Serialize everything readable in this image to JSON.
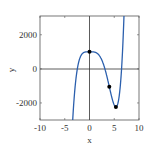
{
  "chart_data": {
    "type": "line",
    "title": "",
    "xlabel": "x",
    "ylabel": "y",
    "xlim": [
      -10,
      10
    ],
    "ylim": [
      -3000,
      3100
    ],
    "xticks": [
      -10,
      -5,
      0,
      5,
      10
    ],
    "xtick_labels": [
      "-10",
      "-5",
      "0",
      "5",
      "10"
    ],
    "yticks": [
      -2000,
      0,
      2000
    ],
    "ytick_labels": [
      "-2000",
      "0",
      "2000"
    ],
    "grid": false,
    "legend": null,
    "function": "y = 3x^5 - 20x^4 + 1000",
    "series": [
      {
        "name": "f(x)",
        "color": "#2b5fad",
        "x": [
          -3.5,
          -3.25,
          -3,
          -2.75,
          -2.5,
          -2.25,
          -2,
          -1.5,
          -1,
          -0.5,
          0,
          0.5,
          1,
          1.5,
          2,
          2.5,
          3,
          3.5,
          4,
          4.5,
          5,
          5.333,
          5.5,
          6,
          6.25,
          6.5,
          6.75,
          7
        ],
        "y": [
          -2826,
          -2089,
          -1349,
          -845,
          -393,
          -81,
          584,
          896,
          977,
          999,
          1000,
          999,
          983,
          921,
          776,
          147.0,
          -701,
          -1360,
          -1048,
          -1932,
          -2125,
          -2236,
          -2213,
          -1592,
          -955,
          108,
          1530,
          3421
        ]
      }
    ],
    "points": [
      {
        "x": 0,
        "y": 1000,
        "label": "local max"
      },
      {
        "x": 4,
        "y": -1048,
        "label": "inflection point"
      },
      {
        "x": 5.333,
        "y": -2236,
        "label": "local min"
      }
    ],
    "reference_lines": {
      "x0": true,
      "y0": true
    }
  }
}
